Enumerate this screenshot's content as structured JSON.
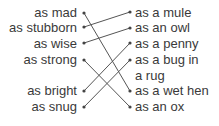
{
  "left_items": [
    {
      "label": "as mad",
      "y": 13
    },
    {
      "label": "as stubborn",
      "y": 28
    },
    {
      "label": "as wise",
      "y": 44
    },
    {
      "label": "as strong",
      "y": 60
    },
    {
      "label": "as bright",
      "y": 91
    },
    {
      "label": "as snug",
      "y": 107
    }
  ],
  "right_items": [
    {
      "label": "as a mule",
      "y": 13
    },
    {
      "label": "as an owl",
      "y": 28
    },
    {
      "label": "as a penny",
      "y": 44
    },
    {
      "label": "as a bug in",
      "y": 60
    },
    {
      "label": "a rug",
      "y": 76
    },
    {
      "label": "as a wet hen",
      "y": 91
    },
    {
      "label": "as an ox",
      "y": 107
    }
  ],
  "connections": [
    {
      "from": "as mad",
      "to": "as a wet hen"
    },
    {
      "from": "as stubborn",
      "to": "as a mule"
    },
    {
      "from": "as wise",
      "to": "as an owl"
    },
    {
      "from": "as strong",
      "to": "as an ox"
    },
    {
      "from": "as bright",
      "to": "as a penny"
    },
    {
      "from": "as snug",
      "to": "as a bug in a rug"
    }
  ],
  "colors": {
    "text": "#3a3a3a",
    "line": "#555555"
  }
}
